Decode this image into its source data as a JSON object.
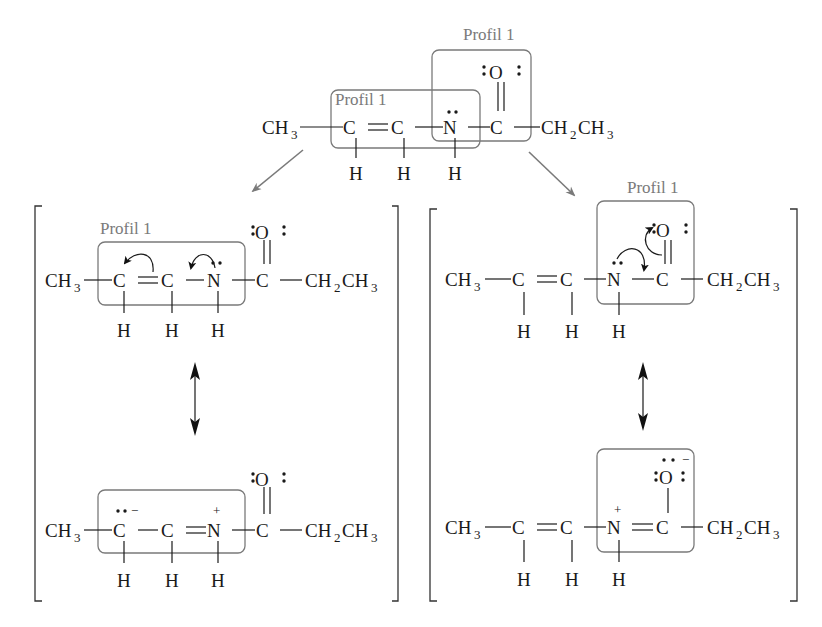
{
  "diagram": {
    "type": "resonance-structures",
    "accent_colors": {
      "box": "#7a7a7a",
      "label": "#7a7a7a",
      "text": "#1a1a1a"
    },
    "labels": {
      "profile": "Profil 1"
    },
    "atoms": {
      "ch3": "CH",
      "ch3_sub": "3",
      "c": "C",
      "n": "N",
      "o": "O",
      "h": "H",
      "ch2": "CH",
      "ch2_sub": "2",
      "ch3b": "CH",
      "ch3b_sub": "3",
      "plus": "+",
      "minus": "−"
    },
    "top_molecule": {
      "formula": "CH3-C=C-N(H)-C(=O)-CH2CH3",
      "boxes": [
        "Profil 1 (C=C-N)",
        "Profil 1 (N-C=O)"
      ]
    },
    "left_panel": {
      "structure_1": "CH3-C=C-N:(H)-C(=O)-CH2CH3 with curved arrows",
      "structure_2": "CH3-C(:-)-C=N(+)(H)-C(=O)-CH2CH3",
      "arrow": "double-headed resonance arrow"
    },
    "right_panel": {
      "structure_1": "CH3-C=C-N:(H)-C(=O)-CH2CH3 with curved arrows",
      "structure_2": "CH3-C=C-N(+)(H)=C(-O:-)-CH2CH3",
      "arrow": "double-headed resonance arrow"
    }
  }
}
